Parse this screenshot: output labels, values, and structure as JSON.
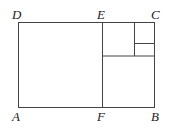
{
  "diagram": {
    "labels": {
      "D": "D",
      "E": "E",
      "C": "C",
      "A": "A",
      "F": "F",
      "B": "B"
    }
  }
}
